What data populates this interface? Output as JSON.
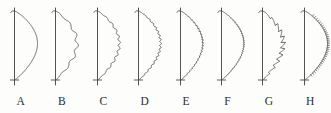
{
  "figure": {
    "background_color": "#fdfdfc",
    "line_color": "#4a4a4a",
    "label_color": "#2b2b2b",
    "item_count": 8
  },
  "leaves": [
    {
      "label": "A",
      "margin_type": "entire",
      "description": "smooth unbroken margin",
      "tooth_count": 0,
      "tooth_depth": 0,
      "tooth_shape": "none"
    },
    {
      "label": "B",
      "margin_type": "undulate",
      "description": "broad shallow waves",
      "tooth_count": 6,
      "tooth_depth": 3.2,
      "tooth_shape": "wave"
    },
    {
      "label": "C",
      "margin_type": "crenate",
      "description": "rounded scallops",
      "tooth_count": 11,
      "tooth_depth": 2.3,
      "tooth_shape": "round"
    },
    {
      "label": "D",
      "margin_type": "crenulate",
      "description": "fine rounded scallops",
      "tooth_count": 17,
      "tooth_depth": 1.8,
      "tooth_shape": "round"
    },
    {
      "label": "E",
      "margin_type": "serrate",
      "description": "fine forward-pointing teeth",
      "tooth_count": 24,
      "tooth_depth": 1.5,
      "tooth_shape": "saw"
    },
    {
      "label": "F",
      "margin_type": "serrulate",
      "description": "very fine dense teeth",
      "tooth_count": 31,
      "tooth_depth": 1.2,
      "tooth_shape": "saw"
    },
    {
      "label": "G",
      "margin_type": "dentate-serrate",
      "description": "large sharp sawtooth teeth",
      "tooth_count": 11,
      "tooth_depth": 4.6,
      "tooth_shape": "saw"
    },
    {
      "label": "H",
      "margin_type": "ciliate",
      "description": "smooth edge fringed with fine hairs",
      "tooth_count": 40,
      "tooth_depth": 1.0,
      "tooth_shape": "cilia"
    }
  ]
}
